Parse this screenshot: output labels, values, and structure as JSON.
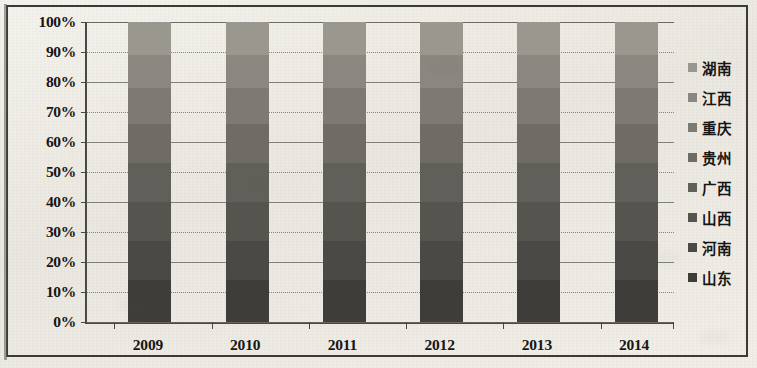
{
  "chart_data": {
    "type": "bar",
    "subtype": "100% stacked bar",
    "title": "",
    "xlabel": "",
    "ylabel": "",
    "categories": [
      "2009",
      "2010",
      "2011",
      "2012",
      "2013",
      "2014"
    ],
    "ytick_labels": [
      "100%",
      "90%",
      "80%",
      "70%",
      "60%",
      "50%",
      "40%",
      "30%",
      "20%",
      "10%",
      "0%"
    ],
    "ytick_values": [
      100,
      90,
      80,
      70,
      60,
      50,
      40,
      30,
      20,
      10,
      0
    ],
    "ylim": [
      0,
      100
    ],
    "ytick_interval": 10,
    "grid": true,
    "grid_axis": "y",
    "legend_position": "right",
    "legend_order_top_to_bottom": [
      "湖南",
      "江西",
      "重庆",
      "贵州",
      "广西",
      "山西",
      "河南",
      "山东"
    ],
    "stack_order_top_to_bottom": [
      "湖南",
      "江西",
      "重庆",
      "贵州",
      "广西",
      "山西",
      "河南",
      "山东"
    ],
    "series": [
      {
        "name": "湖南",
        "color": "#9a978f",
        "values": [
          11,
          11,
          11,
          11,
          11,
          11
        ]
      },
      {
        "name": "江西",
        "color": "#8a8780",
        "values": [
          11,
          11,
          11,
          11,
          11,
          11
        ]
      },
      {
        "name": "重庆",
        "color": "#7d7a73",
        "values": [
          12,
          12,
          12,
          12,
          12,
          12
        ]
      },
      {
        "name": "贵州",
        "color": "#6f6c66",
        "values": [
          13,
          13,
          13,
          13,
          13,
          13
        ]
      },
      {
        "name": "广西",
        "color": "#615f59",
        "values": [
          13,
          13,
          13,
          13,
          13,
          13
        ]
      },
      {
        "name": "山西",
        "color": "#56544f",
        "values": [
          13,
          13,
          13,
          13,
          13,
          13
        ]
      },
      {
        "name": "河南",
        "color": "#4b4945",
        "values": [
          13,
          13,
          13,
          13,
          13,
          13
        ]
      },
      {
        "name": "山东",
        "color": "#3f3d3a",
        "values": [
          14,
          14,
          14,
          14,
          14,
          14
        ]
      }
    ]
  },
  "legend": {
    "items": [
      {
        "label": "湖南",
        "swatch": "#9a978f"
      },
      {
        "label": "江西",
        "swatch": "#8a8780"
      },
      {
        "label": "重庆",
        "swatch": "#7d7a73"
      },
      {
        "label": "贵州",
        "swatch": "#6f6c66"
      },
      {
        "label": "广西",
        "swatch": "#615f59"
      },
      {
        "label": "山西",
        "swatch": "#56544f"
      },
      {
        "label": "河南",
        "swatch": "#4b4945"
      },
      {
        "label": "山东",
        "swatch": "#3f3d3a"
      }
    ]
  },
  "axes": {
    "y_labels": [
      "100%",
      "90%",
      "80%",
      "70%",
      "60%",
      "50%",
      "40%",
      "30%",
      "20%",
      "10%",
      "0%"
    ],
    "x_labels": [
      "2009",
      "2010",
      "2011",
      "2012",
      "2013",
      "2014"
    ]
  },
  "colors": {
    "paper": "#efece6",
    "ink": "#171614",
    "axis": "#4a4844",
    "grid": "#6e6c66",
    "bar_dark": "#3f3d3a",
    "bar_light": "#9a978f"
  }
}
